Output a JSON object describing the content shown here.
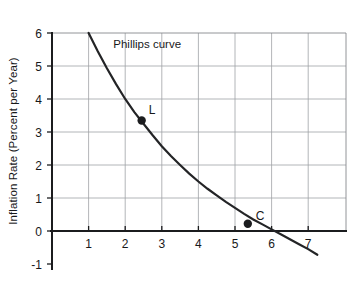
{
  "chart_data": {
    "type": "line",
    "title": "",
    "xlabel": "",
    "ylabel": "Inflation Rate (Percent per Year)",
    "xlim": [
      0,
      7.55
    ],
    "ylim": [
      -1,
      6
    ],
    "grid": true,
    "legend": null,
    "x_ticks": [
      "1",
      "2",
      "3",
      "4",
      "5",
      "6",
      "7"
    ],
    "x_tick_values": [
      1,
      2,
      3,
      4,
      5,
      6,
      7
    ],
    "y_ticks": [
      "6",
      "5",
      "4",
      "3",
      "2",
      "1",
      "0",
      "-1"
    ],
    "y_tick_values": [
      6,
      5,
      4,
      3,
      2,
      1,
      0,
      -1
    ],
    "series": [
      {
        "name": "Phillips curve",
        "label": "Phillips curve",
        "x": [
          1.0,
          1.25,
          1.5,
          1.75,
          2.0,
          2.25,
          2.5,
          2.75,
          3.0,
          3.25,
          3.5,
          3.75,
          4.0,
          4.25,
          4.5,
          4.75,
          5.0,
          5.25,
          5.5,
          5.75,
          6.0,
          6.25,
          6.5,
          6.75,
          7.0,
          7.25
        ],
        "y": [
          6.0,
          5.45,
          4.93,
          4.45,
          4.0,
          3.6,
          3.25,
          2.9,
          2.57,
          2.27,
          2.0,
          1.74,
          1.5,
          1.28,
          1.08,
          0.88,
          0.7,
          0.52,
          0.35,
          0.2,
          0.05,
          -0.1,
          -0.25,
          -0.4,
          -0.55,
          -0.72
        ]
      }
    ],
    "annotations": [
      {
        "text": "Phillips curve",
        "x": 2.6,
        "y": 5.55,
        "name": "curve-name-label"
      }
    ],
    "points": [
      {
        "label": "L",
        "x": 2.45,
        "y": 3.35,
        "label_dx": 7,
        "label_dy": -6
      },
      {
        "label": "C",
        "x": 5.35,
        "y": 0.22,
        "label_dx": 8,
        "label_dy": -4
      }
    ]
  }
}
